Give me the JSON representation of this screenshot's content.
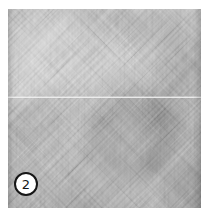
{
  "figure": {
    "badge": {
      "label": "2"
    },
    "colors": {
      "page_background": "#ffffff",
      "texture_base": "#c9c9c9",
      "seam_line": "#f1f1f1",
      "badge_background": "#ffffff",
      "badge_ring": "#161616",
      "badge_text": "#161616"
    }
  }
}
